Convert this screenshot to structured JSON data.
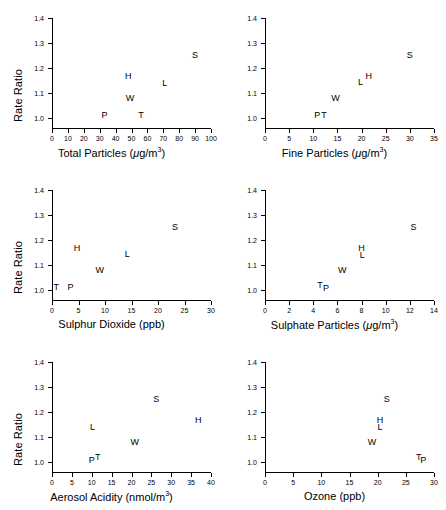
{
  "figure": {
    "panel_count": 6,
    "shared_ylabel": "Rate Ratio",
    "y_ticks": [
      "1.0",
      "1.1",
      "1.2",
      "1.3",
      "1.4"
    ],
    "y_tick_values": [
      1.0,
      1.1,
      1.2,
      1.3,
      1.4
    ],
    "ylim": [
      0.96,
      1.4
    ]
  },
  "chart_data": [
    {
      "type": "scatter",
      "title": "",
      "xlabel": "Total Particles (μg/m³)",
      "xlabel_plain": "Total Particles (ug/m3)",
      "ylabel": "Rate Ratio",
      "xlim": [
        0,
        100
      ],
      "ylim": [
        0.96,
        1.4
      ],
      "x_ticks": [
        0,
        10,
        20,
        30,
        40,
        50,
        60,
        70,
        80,
        90,
        100
      ],
      "x_tick_labels": [
        "0",
        "10",
        "20",
        "30",
        "40",
        "50",
        "60",
        "70",
        "80",
        "90",
        "100"
      ],
      "y_ticks": [
        1.0,
        1.1,
        1.2,
        1.3,
        1.4
      ],
      "y_tick_labels": [
        "1.0",
        "1.1",
        "1.2",
        "1.3",
        "1.4"
      ],
      "grid": false,
      "legend": "none",
      "show_ylabel": true,
      "points": [
        {
          "label": "P",
          "x": 33.0,
          "y": 1.008
        },
        {
          "label": "T",
          "x": 56.0,
          "y": 1.008
        },
        {
          "label": "W",
          "x": 49.0,
          "y": 1.075
        },
        {
          "label": "H",
          "x": 48.0,
          "y": 1.165
        },
        {
          "label": "L",
          "x": 71.0,
          "y": 1.138
        },
        {
          "label": "S",
          "x": 90.0,
          "y": 1.248
        }
      ]
    },
    {
      "type": "scatter",
      "title": "",
      "xlabel": "Fine Particles (μg/m³)",
      "xlabel_plain": "Fine Particles (ug/m3)",
      "ylabel": "Rate Ratio",
      "xlim": [
        0,
        35
      ],
      "ylim": [
        0.96,
        1.4
      ],
      "x_ticks": [
        0,
        5,
        10,
        15,
        20,
        25,
        30,
        35
      ],
      "x_tick_labels": [
        "0",
        "5",
        "10",
        "15",
        "20",
        "25",
        "30",
        "35"
      ],
      "y_ticks": [
        1.0,
        1.1,
        1.2,
        1.3,
        1.4
      ],
      "y_tick_labels": [
        "1.0",
        "1.1",
        "1.2",
        "1.3",
        "1.4"
      ],
      "grid": false,
      "legend": "none",
      "show_ylabel": false,
      "points": [
        {
          "label": "P",
          "x": 10.8,
          "y": 1.008
        },
        {
          "label": "T",
          "x": 12.2,
          "y": 1.01
        },
        {
          "label": "W",
          "x": 14.6,
          "y": 1.075
        },
        {
          "label": "L",
          "x": 19.8,
          "y": 1.14
        },
        {
          "label": "H",
          "x": 21.5,
          "y": 1.165
        },
        {
          "label": "S",
          "x": 30.0,
          "y": 1.248
        }
      ]
    },
    {
      "type": "scatter",
      "title": "",
      "xlabel": "Sulphur Dioxide (ppb)",
      "xlabel_plain": "Sulphur Dioxide (ppb)",
      "ylabel": "Rate Ratio",
      "xlim": [
        0,
        30
      ],
      "ylim": [
        0.96,
        1.4
      ],
      "x_ticks": [
        0,
        5,
        10,
        15,
        20,
        25,
        30
      ],
      "x_tick_labels": [
        "0",
        "5",
        "10",
        "15",
        "20",
        "25",
        "30"
      ],
      "y_ticks": [
        1.0,
        1.1,
        1.2,
        1.3,
        1.4
      ],
      "y_tick_labels": [
        "1.0",
        "1.1",
        "1.2",
        "1.3",
        "1.4"
      ],
      "grid": false,
      "legend": "none",
      "show_ylabel": true,
      "points": [
        {
          "label": "T",
          "x": 0.8,
          "y": 1.01
        },
        {
          "label": "P",
          "x": 3.5,
          "y": 1.008
        },
        {
          "label": "H",
          "x": 4.7,
          "y": 1.165
        },
        {
          "label": "W",
          "x": 9.0,
          "y": 1.078
        },
        {
          "label": "L",
          "x": 14.2,
          "y": 1.14
        },
        {
          "label": "S",
          "x": 23.2,
          "y": 1.25
        }
      ]
    },
    {
      "type": "scatter",
      "title": "",
      "xlabel": "Sulphate Particles (μg/m³)",
      "xlabel_plain": "Sulphate Particles (ug/m3)",
      "ylabel": "Rate Ratio",
      "xlim": [
        0,
        14
      ],
      "ylim": [
        0.96,
        1.4
      ],
      "x_ticks": [
        0,
        2,
        4,
        6,
        8,
        10,
        12,
        14
      ],
      "x_tick_labels": [
        "0",
        "2",
        "4",
        "6",
        "8",
        "10",
        "12",
        "14"
      ],
      "y_ticks": [
        1.0,
        1.1,
        1.2,
        1.3,
        1.4
      ],
      "y_tick_labels": [
        "1.0",
        "1.1",
        "1.2",
        "1.3",
        "1.4"
      ],
      "grid": false,
      "legend": "none",
      "show_ylabel": false,
      "points": [
        {
          "label": "T",
          "x": 4.55,
          "y": 1.018
        },
        {
          "label": "P",
          "x": 5.05,
          "y": 1.005
        },
        {
          "label": "W",
          "x": 6.4,
          "y": 1.078
        },
        {
          "label": "H",
          "x": 8.0,
          "y": 1.163
        },
        {
          "label": "L",
          "x": 8.05,
          "y": 1.138
        },
        {
          "label": "S",
          "x": 12.3,
          "y": 1.25
        }
      ]
    },
    {
      "type": "scatter",
      "title": "",
      "xlabel": "Aerosol Acidity (nmol/m³)",
      "xlabel_plain": "Aerosol Acidity (nmol/m3)",
      "ylabel": "Rate Ratio",
      "xlim": [
        0,
        40
      ],
      "ylim": [
        0.96,
        1.4
      ],
      "x_ticks": [
        0,
        5,
        10,
        15,
        20,
        25,
        30,
        35,
        40
      ],
      "x_tick_labels": [
        "0",
        "5",
        "10",
        "15",
        "20",
        "25",
        "30",
        "35",
        "40"
      ],
      "y_ticks": [
        1.0,
        1.1,
        1.2,
        1.3,
        1.4
      ],
      "y_tick_labels": [
        "1.0",
        "1.1",
        "1.2",
        "1.3",
        "1.4"
      ],
      "grid": false,
      "legend": "none",
      "show_ylabel": true,
      "points": [
        {
          "label": "P",
          "x": 10.0,
          "y": 1.005
        },
        {
          "label": "T",
          "x": 11.5,
          "y": 1.018
        },
        {
          "label": "L",
          "x": 10.2,
          "y": 1.138
        },
        {
          "label": "W",
          "x": 20.8,
          "y": 1.075
        },
        {
          "label": "S",
          "x": 26.2,
          "y": 1.248
        },
        {
          "label": "H",
          "x": 36.8,
          "y": 1.165
        }
      ]
    },
    {
      "type": "scatter",
      "title": "",
      "xlabel": "Ozone (ppb)",
      "xlabel_plain": "Ozone (ppb)",
      "ylabel": "Rate Ratio",
      "xlim": [
        0,
        30
      ],
      "ylim": [
        0.96,
        1.4
      ],
      "x_ticks": [
        0,
        5,
        10,
        15,
        20,
        25,
        30
      ],
      "x_tick_labels": [
        "0",
        "5",
        "10",
        "15",
        "20",
        "25",
        "30"
      ],
      "y_ticks": [
        1.0,
        1.1,
        1.2,
        1.3,
        1.4
      ],
      "y_tick_labels": [
        "1.0",
        "1.1",
        "1.2",
        "1.3",
        "1.4"
      ],
      "grid": false,
      "legend": "none",
      "show_ylabel": false,
      "points": [
        {
          "label": "W",
          "x": 19.0,
          "y": 1.075
        },
        {
          "label": "H",
          "x": 20.4,
          "y": 1.163
        },
        {
          "label": "L",
          "x": 20.4,
          "y": 1.138
        },
        {
          "label": "S",
          "x": 21.6,
          "y": 1.248
        },
        {
          "label": "T",
          "x": 27.3,
          "y": 1.018
        },
        {
          "label": "P",
          "x": 28.1,
          "y": 1.005
        }
      ]
    }
  ]
}
